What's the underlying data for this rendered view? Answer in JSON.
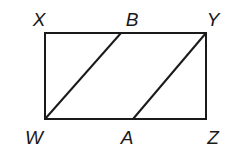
{
  "diagram": {
    "type": "geometry",
    "stroke_color": "#1a1a1a",
    "rectangle": {
      "name": "WXYZ",
      "vertices": {
        "X": [
          45,
          33
        ],
        "Y": [
          206,
          33
        ],
        "Z": [
          206,
          119
        ],
        "W": [
          45,
          119
        ]
      }
    },
    "points": {
      "B": [
        121,
        33
      ],
      "A": [
        133,
        119
      ]
    },
    "segments": [
      {
        "from": "W",
        "to": "B"
      },
      {
        "from": "A",
        "to": "Y"
      }
    ],
    "labels": [
      {
        "text": "X",
        "x": 39,
        "y": 19
      },
      {
        "text": "B",
        "x": 132,
        "y": 19
      },
      {
        "text": "Y",
        "x": 213,
        "y": 19
      },
      {
        "text": "W",
        "x": 34,
        "y": 137
      },
      {
        "text": "A",
        "x": 127,
        "y": 137
      },
      {
        "text": "Z",
        "x": 213,
        "y": 137
      }
    ]
  }
}
